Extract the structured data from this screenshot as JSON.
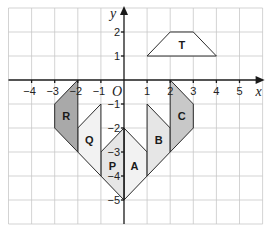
{
  "figure": {
    "type": "coordinate-grid-diagram",
    "axes": {
      "x_label": "x",
      "y_label": "y",
      "origin_label": "O",
      "x_ticks": [
        "-4",
        "-3",
        "-2",
        "-1",
        "1",
        "2",
        "3",
        "4",
        "5"
      ],
      "y_ticks": [
        "2",
        "1",
        "-1",
        "-2",
        "-3",
        "-4",
        "-5"
      ],
      "x_range": [
        -5,
        6
      ],
      "y_range": [
        -6,
        3
      ]
    },
    "shapes": [
      {
        "label": "T",
        "fill": "#ffffff",
        "vertices": [
          [
            1,
            1
          ],
          [
            2,
            2
          ],
          [
            3,
            2
          ],
          [
            4,
            1
          ]
        ],
        "label_pos": [
          2.5,
          1.45
        ]
      },
      {
        "label": "A",
        "fill": "#f2f2f2",
        "vertices": [
          [
            0,
            -2
          ],
          [
            1,
            -3
          ],
          [
            1,
            -4
          ],
          [
            0,
            -5
          ]
        ],
        "label_pos": [
          0.45,
          -3.6
        ]
      },
      {
        "label": "P",
        "fill": "#e6e6e6",
        "vertices": [
          [
            0,
            -2
          ],
          [
            -1,
            -3
          ],
          [
            -1,
            -4
          ],
          [
            0,
            -5
          ]
        ],
        "label_pos": [
          -0.5,
          -3.6
        ]
      },
      {
        "label": "B",
        "fill": "#e6e6e6",
        "vertices": [
          [
            1,
            -1
          ],
          [
            2,
            -2
          ],
          [
            2,
            -3
          ],
          [
            1,
            -4
          ]
        ],
        "label_pos": [
          1.5,
          -2.5
        ]
      },
      {
        "label": "Q",
        "fill": "#f2f2f2",
        "vertices": [
          [
            -1,
            -1
          ],
          [
            -2,
            -2
          ],
          [
            -2,
            -3
          ],
          [
            -1,
            -4
          ]
        ],
        "label_pos": [
          -1.5,
          -2.5
        ]
      },
      {
        "label": "C",
        "fill": "#c8c8c8",
        "vertices": [
          [
            2,
            0
          ],
          [
            3,
            -1
          ],
          [
            3,
            -2
          ],
          [
            2,
            -3
          ]
        ],
        "label_pos": [
          2.5,
          -1.5
        ]
      },
      {
        "label": "R",
        "fill": "#a9a9a9",
        "vertices": [
          [
            -2,
            0
          ],
          [
            -3,
            -1
          ],
          [
            -3,
            -2
          ],
          [
            -2,
            -3
          ]
        ],
        "label_pos": [
          -2.5,
          -1.5
        ]
      }
    ]
  }
}
